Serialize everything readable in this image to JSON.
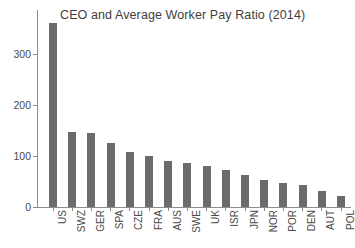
{
  "chart_data": {
    "type": "bar",
    "title": "CEO and Average Worker Pay Ratio (2014)",
    "xlabel": "",
    "ylabel": "",
    "ylim": [
      0,
      370
    ],
    "yticks": [
      0,
      100,
      200,
      300
    ],
    "ytick_labels": [
      "0",
      "100",
      "200",
      "300"
    ],
    "grid": false,
    "legend": null,
    "orientation": "vertical",
    "bar_color": "#6b6b6b",
    "axis_color": "#8c8c8c",
    "categories": [
      "US",
      "SWZ",
      "GER",
      "SPA",
      "CZE",
      "FRA",
      "AUS",
      "SWE",
      "UK",
      "ISR",
      "JPN",
      "NOR",
      "POR",
      "DEN",
      "AUT",
      "POL"
    ],
    "values": [
      361,
      148,
      145,
      125,
      108,
      101,
      91,
      87,
      80,
      72,
      63,
      53,
      48,
      43,
      31,
      22
    ]
  }
}
